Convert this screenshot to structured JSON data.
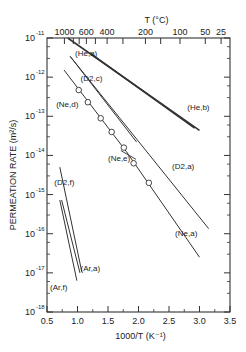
{
  "chart_data": {
    "type": "line",
    "title": "",
    "xlabel": "1000/T (K⁻¹)",
    "ylabel": "PERMEATION RATE (m²/s)",
    "top_axis_label": "T (°C)",
    "xlim": [
      0.5,
      3.5
    ],
    "ylim_log10": [
      -18,
      -11
    ],
    "yscale": "log",
    "grid": false,
    "x_ticks": [
      0.5,
      1.0,
      1.5,
      2.0,
      2.5,
      3.0,
      3.5
    ],
    "x_tick_labels": [
      "0.5",
      "1.0",
      "1.5",
      "2.0",
      "2.5",
      "3.0",
      "3.5"
    ],
    "y_ticks_log10": [
      -11,
      -12,
      -13,
      -14,
      -15,
      -16,
      -17,
      -18
    ],
    "y_tick_labels": [
      "10",
      "10",
      "10",
      "10",
      "10",
      "10",
      "10",
      "10"
    ],
    "y_tick_exponents": [
      "-11",
      "-12",
      "-13",
      "-14",
      "-15",
      "-16",
      "-17",
      "-18"
    ],
    "top_ticks_celsius": [
      1000,
      800,
      700,
      600,
      500,
      400,
      300,
      200,
      150,
      100,
      50,
      25
    ],
    "top_tick_labels": [
      {
        "label": "1000",
        "celsius": 1000
      },
      {
        "label": "600",
        "celsius": 600
      },
      {
        "label": "400",
        "celsius": 400
      },
      {
        "label": "200",
        "celsius": 200
      },
      {
        "label": "100",
        "celsius": 100
      },
      {
        "label": "50",
        "celsius": 50
      },
      {
        "label": "25",
        "celsius": 25
      }
    ],
    "series": [
      {
        "name": "(He,a)",
        "x": [
          0.84,
          3.0
        ],
        "log10_y": [
          -11.0,
          -13.36
        ]
      },
      {
        "name": "(He,b)",
        "x": [
          1.2,
          2.92
        ],
        "log10_y": [
          -11.38,
          -13.3
        ]
      },
      {
        "name": "(D2,c)",
        "x": [
          0.88,
          1.97
        ],
        "log10_y": [
          -11.47,
          -13.66
        ]
      },
      {
        "name": "(D2,a)",
        "x": [
          0.88,
          3.15
        ],
        "log10_y": [
          -11.47,
          -15.87
        ]
      },
      {
        "name": "(Ne,d)",
        "x": [
          0.78,
          1.8
        ],
        "log10_y": [
          -11.82,
          -13.9
        ]
      },
      {
        "name": "(Ne,e)",
        "x": [
          1.02,
          1.17,
          1.38,
          1.56,
          1.76,
          1.92,
          2.17
        ],
        "log10_y": [
          -12.33,
          -12.64,
          -13.05,
          -13.4,
          -13.8,
          -14.2,
          -14.7
        ],
        "marker": "open-circle"
      },
      {
        "name": "(Ne,a)",
        "x": [
          1.8,
          3.0
        ],
        "log10_y": [
          -13.9,
          -16.6
        ]
      },
      {
        "name": "(D2,f)",
        "x": [
          0.71,
          1.07
        ],
        "log10_y": [
          -14.3,
          -16.97
        ]
      },
      {
        "name": "(Ar,a)",
        "x": [
          0.74,
          1.04
        ],
        "log10_y": [
          -15.14,
          -17.0
        ]
      },
      {
        "name": "(Ar,f)",
        "x": [
          0.71,
          0.99
        ],
        "log10_y": [
          -15.14,
          -17.2
        ]
      }
    ],
    "annotations": [
      {
        "text": "(He,a)",
        "x": 0.96,
        "log10_y": -11.45
      },
      {
        "text": "(He,b)",
        "x": 2.8,
        "log10_y": -12.85
      },
      {
        "text": "(D2,c)",
        "x": 1.05,
        "log10_y": -12.1
      },
      {
        "text": "(D2,a)",
        "x": 2.55,
        "log10_y": -14.35
      },
      {
        "text": "(Ne,d)",
        "x": 0.65,
        "log10_y": -12.75
      },
      {
        "text": "(Ne,e)",
        "x": 1.5,
        "log10_y": -14.15
      },
      {
        "text": "(Ne,a)",
        "x": 2.6,
        "log10_y": -16.05
      },
      {
        "text": "(D2,f)",
        "x": 0.62,
        "log10_y": -14.75
      },
      {
        "text": "(Ar,a)",
        "x": 1.05,
        "log10_y": -16.95
      },
      {
        "text": "(Ar,f)",
        "x": 0.55,
        "log10_y": -17.45
      }
    ]
  }
}
